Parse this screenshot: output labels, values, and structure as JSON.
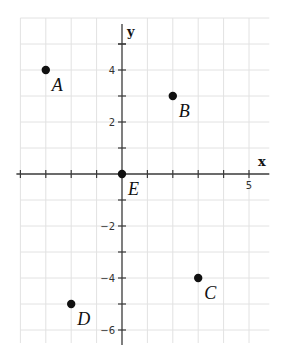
{
  "diagram": {
    "type": "coordinate-plane",
    "axes": {
      "x_label": "x",
      "y_label": "y",
      "x_range": [
        -4,
        5.8
      ],
      "y_range": [
        -6.5,
        6
      ],
      "x_tick_labels": [
        {
          "value": 5,
          "text": "5"
        }
      ],
      "y_tick_labels": [
        {
          "value": 4,
          "text": "4"
        },
        {
          "value": 2,
          "text": "2"
        },
        {
          "value": -2,
          "text": "−2"
        },
        {
          "value": -4,
          "text": "−4"
        },
        {
          "value": -6,
          "text": "−6"
        }
      ],
      "grid": true,
      "grid_spacing": 1
    },
    "points": [
      {
        "label": "A",
        "x": -3,
        "y": 4
      },
      {
        "label": "B",
        "x": 2,
        "y": 3
      },
      {
        "label": "C",
        "x": 3,
        "y": -4
      },
      {
        "label": "D",
        "x": -2,
        "y": -5
      },
      {
        "label": "E",
        "x": 0,
        "y": 0
      }
    ],
    "colors": {
      "grid": "#e2e2e2",
      "axis": "#3a3a3a",
      "point": "#111111"
    }
  }
}
